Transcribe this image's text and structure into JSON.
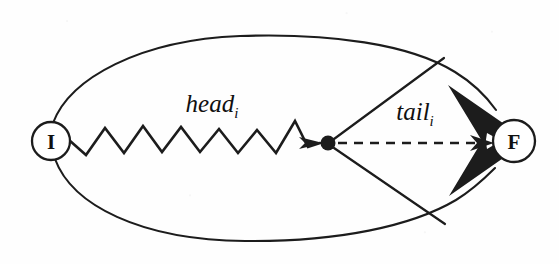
{
  "figure": {
    "kind": "graph-diagram",
    "background_color": "#fefefe",
    "ink_color": "#1c1c1c",
    "width": 559,
    "height": 264,
    "nodes": [
      {
        "id": "initial",
        "label": "I",
        "name": "node-i",
        "cx": 51,
        "cy": 141,
        "r": 19
      },
      {
        "id": "final",
        "label": "F",
        "name": "node-f",
        "cx": 514,
        "cy": 141,
        "r": 21
      }
    ],
    "junction": {
      "name": "junction-dot",
      "cx": 328,
      "cy": 143,
      "r": 7.5
    },
    "edge_labels": [
      {
        "name": "head-label",
        "base": "head",
        "subscript": "i",
        "x": 212,
        "y": 112
      },
      {
        "name": "tail-label",
        "base": "tail",
        "subscript": "i",
        "x": 415,
        "y": 120
      }
    ],
    "edges": [
      {
        "name": "head-zigzag-edge",
        "style": "zigzag",
        "from": "initial",
        "to": "junction",
        "arrowhead": "small-filled"
      },
      {
        "name": "tail-dashed-edge",
        "style": "dashed",
        "from": "junction",
        "to": "final",
        "arrowhead": "small-filled"
      },
      {
        "name": "upper-branch-edge",
        "style": "straight",
        "from": "junction",
        "to": "upper-arc"
      },
      {
        "name": "lower-branch-edge",
        "style": "straight",
        "from": "junction",
        "to": "lower-arc"
      },
      {
        "name": "upper-arc-edge",
        "style": "curve",
        "from": "initial",
        "to": "final",
        "arrowhead": "large-filled"
      },
      {
        "name": "lower-arc-edge",
        "style": "curve",
        "from": "initial",
        "to": "final",
        "arrowhead": "large-filled"
      }
    ]
  }
}
